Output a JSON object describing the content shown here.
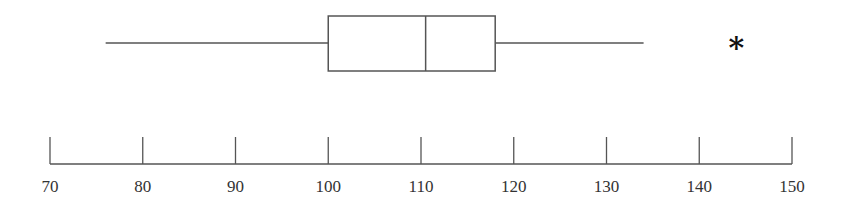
{
  "chart_data": {
    "type": "boxplot",
    "title": "",
    "xlabel": "",
    "ylabel": "",
    "orientation": "horizontal",
    "xlim": [
      70,
      150
    ],
    "ticks": [
      70,
      80,
      90,
      100,
      110,
      120,
      130,
      140,
      150
    ],
    "tick_labels": [
      "70",
      "80",
      "90",
      "100",
      "110",
      "120",
      "130",
      "140",
      "150"
    ],
    "grid": false,
    "legend": null,
    "series": [
      {
        "name": "",
        "whisker_low": 76,
        "q1": 100,
        "median": 110.5,
        "q3": 118,
        "whisker_high": 134,
        "outliers": [
          144
        ]
      }
    ],
    "outlier_marker": "*",
    "colors": {
      "line": "#555555",
      "text": "#333333",
      "outlier": "#111111"
    }
  }
}
